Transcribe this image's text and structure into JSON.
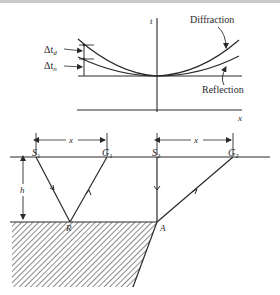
{
  "top_plot": {
    "axis_t_label": "t",
    "axis_x_label": "x",
    "curves": [
      {
        "name": "Diffraction",
        "label": "Diffraction"
      },
      {
        "name": "Reflection",
        "label": "Reflection"
      }
    ],
    "delta_labels": {
      "d": "Δtₙ",
      "n": "Δtₙ"
    },
    "delta_d_main": "Δt",
    "delta_d_sub": "d",
    "delta_n_main": "Δt",
    "delta_n_sub": "n"
  },
  "bottom_diagram": {
    "source_1": {
      "main": "S",
      "sub": "1"
    },
    "geophone_1": {
      "main": "G",
      "sub": "1"
    },
    "source_2": {
      "main": "S",
      "sub": "2"
    },
    "geophone_2": {
      "main": "G",
      "sub": "2"
    },
    "offset_label_1": "x",
    "offset_label_2": "x",
    "depth_label": "h",
    "reflection_point": "R",
    "diffraction_point": "A"
  },
  "colors": {
    "ink": "#2a2a2a",
    "background": "#ffffff",
    "top_strip": "#c9c9c9"
  }
}
